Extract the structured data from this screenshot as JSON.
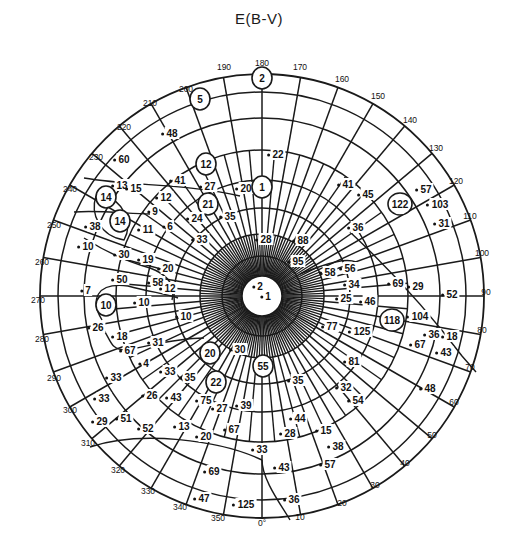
{
  "title": "E(B-V)",
  "chart_data": {
    "type": "polar-scatter",
    "title": "E(B-V)",
    "geometry": {
      "cx": 262,
      "cy": 296,
      "r_outer": 222,
      "rings": 8,
      "spokes_outer_deg": 10
    },
    "angle_ticks": [
      "0°",
      "10",
      "20",
      "30",
      "40",
      "50",
      "60",
      "70",
      "80",
      "90",
      "100",
      "110",
      "120",
      "130",
      "140",
      "150",
      "160",
      "170",
      "180",
      "190",
      "200",
      "210",
      "220",
      "230",
      "240",
      "250",
      "260",
      "270",
      "280",
      "290",
      "300",
      "310",
      "320",
      "330",
      "340",
      "350"
    ],
    "tick_positions": [
      {
        "t": "0°",
        "x": 262,
        "y": 526
      },
      {
        "t": "10",
        "x": 300,
        "y": 520
      },
      {
        "t": "20",
        "x": 342,
        "y": 506
      },
      {
        "t": "30",
        "x": 375,
        "y": 488
      },
      {
        "t": "40",
        "x": 405,
        "y": 466
      },
      {
        "t": "50",
        "x": 432,
        "y": 438
      },
      {
        "t": "60",
        "x": 454,
        "y": 405
      },
      {
        "t": "70",
        "x": 470,
        "y": 370
      },
      {
        "t": "80",
        "x": 482,
        "y": 333
      },
      {
        "t": "90",
        "x": 486,
        "y": 295
      },
      {
        "t": "100",
        "x": 482,
        "y": 256
      },
      {
        "t": "110",
        "x": 470,
        "y": 219
      },
      {
        "t": "120",
        "x": 456,
        "y": 184
      },
      {
        "t": "130",
        "x": 436,
        "y": 151
      },
      {
        "t": "140",
        "x": 410,
        "y": 123
      },
      {
        "t": "150",
        "x": 378,
        "y": 99
      },
      {
        "t": "160",
        "x": 342,
        "y": 82
      },
      {
        "t": "170",
        "x": 300,
        "y": 70
      },
      {
        "t": "180",
        "x": 262,
        "y": 66
      },
      {
        "t": "190",
        "x": 224,
        "y": 70
      },
      {
        "t": "200",
        "x": 186,
        "y": 92
      },
      {
        "t": "210",
        "x": 150,
        "y": 106
      },
      {
        "t": "220",
        "x": 124,
        "y": 130
      },
      {
        "t": "230",
        "x": 96,
        "y": 160
      },
      {
        "t": "240",
        "x": 70,
        "y": 192
      },
      {
        "t": "250",
        "x": 54,
        "y": 228
      },
      {
        "t": "260",
        "x": 42,
        "y": 265
      },
      {
        "t": "270",
        "x": 38,
        "y": 303
      },
      {
        "t": "280",
        "x": 42,
        "y": 342
      },
      {
        "t": "290",
        "x": 54,
        "y": 381
      },
      {
        "t": "300",
        "x": 70,
        "y": 413
      },
      {
        "t": "310",
        "x": 88,
        "y": 446
      },
      {
        "t": "320",
        "x": 118,
        "y": 473
      },
      {
        "t": "330",
        "x": 148,
        "y": 494
      },
      {
        "t": "340",
        "x": 180,
        "y": 510
      },
      {
        "t": "350",
        "x": 218,
        "y": 521
      }
    ],
    "values": [
      {
        "v": "2",
        "x": 262,
        "y": 82,
        "circled": true
      },
      {
        "v": "5",
        "x": 200,
        "y": 103,
        "circled": true
      },
      {
        "v": "48",
        "x": 172,
        "y": 137
      },
      {
        "v": "22",
        "x": 278,
        "y": 158
      },
      {
        "v": "60",
        "x": 124,
        "y": 163
      },
      {
        "v": "12",
        "x": 206,
        "y": 168,
        "circled": true
      },
      {
        "v": "13",
        "x": 122,
        "y": 189
      },
      {
        "v": "15",
        "x": 136,
        "y": 192
      },
      {
        "v": "41",
        "x": 180,
        "y": 184
      },
      {
        "v": "27",
        "x": 210,
        "y": 190
      },
      {
        "v": "20",
        "x": 246,
        "y": 192
      },
      {
        "v": "1",
        "x": 262,
        "y": 191,
        "circled": true
      },
      {
        "v": "14",
        "x": 106,
        "y": 201,
        "circled": true
      },
      {
        "v": "12",
        "x": 166,
        "y": 201
      },
      {
        "v": "9",
        "x": 155,
        "y": 215
      },
      {
        "v": "21",
        "x": 208,
        "y": 208,
        "circled": true
      },
      {
        "v": "35",
        "x": 230,
        "y": 220
      },
      {
        "v": "24",
        "x": 197,
        "y": 222
      },
      {
        "v": "14",
        "x": 120,
        "y": 225,
        "circled": true
      },
      {
        "v": "38",
        "x": 95,
        "y": 230
      },
      {
        "v": "11",
        "x": 148,
        "y": 233
      },
      {
        "v": "6",
        "x": 170,
        "y": 230
      },
      {
        "v": "10",
        "x": 88,
        "y": 250
      },
      {
        "v": "33",
        "x": 202,
        "y": 243
      },
      {
        "v": "28",
        "x": 266,
        "y": 243
      },
      {
        "v": "88",
        "x": 303,
        "y": 244
      },
      {
        "v": "95",
        "x": 298,
        "y": 265
      },
      {
        "v": "30",
        "x": 124,
        "y": 258
      },
      {
        "v": "19",
        "x": 148,
        "y": 263
      },
      {
        "v": "20",
        "x": 168,
        "y": 272
      },
      {
        "v": "50",
        "x": 122,
        "y": 283
      },
      {
        "v": "58",
        "x": 158,
        "y": 286
      },
      {
        "v": "12",
        "x": 170,
        "y": 292
      },
      {
        "v": "7",
        "x": 88,
        "y": 294
      },
      {
        "v": "10",
        "x": 144,
        "y": 306
      },
      {
        "v": "10",
        "x": 106,
        "y": 309,
        "circled": true
      },
      {
        "v": "10",
        "x": 186,
        "y": 320
      },
      {
        "v": "26",
        "x": 98,
        "y": 331
      },
      {
        "v": "18",
        "x": 122,
        "y": 340
      },
      {
        "v": "67",
        "x": 130,
        "y": 354
      },
      {
        "v": "31",
        "x": 158,
        "y": 346
      },
      {
        "v": "41",
        "x": 348,
        "y": 188
      },
      {
        "v": "45",
        "x": 368,
        "y": 198
      },
      {
        "v": "122",
        "x": 400,
        "y": 208,
        "circled": true
      },
      {
        "v": "57",
        "x": 426,
        "y": 193
      },
      {
        "v": "103",
        "x": 440,
        "y": 208
      },
      {
        "v": "31",
        "x": 444,
        "y": 227
      },
      {
        "v": "36",
        "x": 358,
        "y": 231
      },
      {
        "v": "56",
        "x": 350,
        "y": 272
      },
      {
        "v": "58",
        "x": 330,
        "y": 276
      },
      {
        "v": "34",
        "x": 354,
        "y": 288
      },
      {
        "v": "69",
        "x": 398,
        "y": 287
      },
      {
        "v": "29",
        "x": 418,
        "y": 290
      },
      {
        "v": "52",
        "x": 452,
        "y": 298
      },
      {
        "v": "25",
        "x": 346,
        "y": 302
      },
      {
        "v": "46",
        "x": 370,
        "y": 305
      },
      {
        "v": "118",
        "x": 392,
        "y": 324,
        "circled": true
      },
      {
        "v": "104",
        "x": 420,
        "y": 320
      },
      {
        "v": "77",
        "x": 332,
        "y": 330
      },
      {
        "v": "125",
        "x": 362,
        "y": 335
      },
      {
        "v": "36",
        "x": 434,
        "y": 338
      },
      {
        "v": "18",
        "x": 452,
        "y": 340
      },
      {
        "v": "67",
        "x": 420,
        "y": 348
      },
      {
        "v": "43",
        "x": 446,
        "y": 356
      },
      {
        "v": "81",
        "x": 354,
        "y": 365
      },
      {
        "v": "20",
        "x": 210,
        "y": 357,
        "circled": true
      },
      {
        "v": "30",
        "x": 240,
        "y": 353
      },
      {
        "v": "55",
        "x": 263,
        "y": 370,
        "circled": true
      },
      {
        "v": "35",
        "x": 298,
        "y": 384
      },
      {
        "v": "32",
        "x": 346,
        "y": 391
      },
      {
        "v": "54",
        "x": 358,
        "y": 404
      },
      {
        "v": "48",
        "x": 430,
        "y": 392
      },
      {
        "v": "4",
        "x": 146,
        "y": 367
      },
      {
        "v": "33",
        "x": 116,
        "y": 381
      },
      {
        "v": "33",
        "x": 170,
        "y": 375
      },
      {
        "v": "35",
        "x": 190,
        "y": 381
      },
      {
        "v": "22",
        "x": 216,
        "y": 386,
        "circled": true
      },
      {
        "v": "33",
        "x": 104,
        "y": 402
      },
      {
        "v": "26",
        "x": 152,
        "y": 399
      },
      {
        "v": "43",
        "x": 176,
        "y": 401
      },
      {
        "v": "75",
        "x": 206,
        "y": 404
      },
      {
        "v": "39",
        "x": 246,
        "y": 409
      },
      {
        "v": "27",
        "x": 222,
        "y": 412
      },
      {
        "v": "29",
        "x": 102,
        "y": 425
      },
      {
        "v": "51",
        "x": 126,
        "y": 422
      },
      {
        "v": "52",
        "x": 148,
        "y": 432
      },
      {
        "v": "13",
        "x": 184,
        "y": 430
      },
      {
        "v": "20",
        "x": 206,
        "y": 440
      },
      {
        "v": "67",
        "x": 234,
        "y": 433
      },
      {
        "v": "44",
        "x": 300,
        "y": 422
      },
      {
        "v": "28",
        "x": 290,
        "y": 437
      },
      {
        "v": "15",
        "x": 326,
        "y": 434
      },
      {
        "v": "38",
        "x": 338,
        "y": 450
      },
      {
        "v": "33",
        "x": 262,
        "y": 453
      },
      {
        "v": "57",
        "x": 330,
        "y": 468
      },
      {
        "v": "69",
        "x": 214,
        "y": 475
      },
      {
        "v": "43",
        "x": 284,
        "y": 471
      },
      {
        "v": "47",
        "x": 204,
        "y": 502
      },
      {
        "v": "125",
        "x": 246,
        "y": 508
      },
      {
        "v": "36",
        "x": 294,
        "y": 503
      },
      {
        "v": "2",
        "x": 260,
        "y": 290
      },
      {
        "v": "1",
        "x": 268,
        "y": 300
      }
    ]
  }
}
